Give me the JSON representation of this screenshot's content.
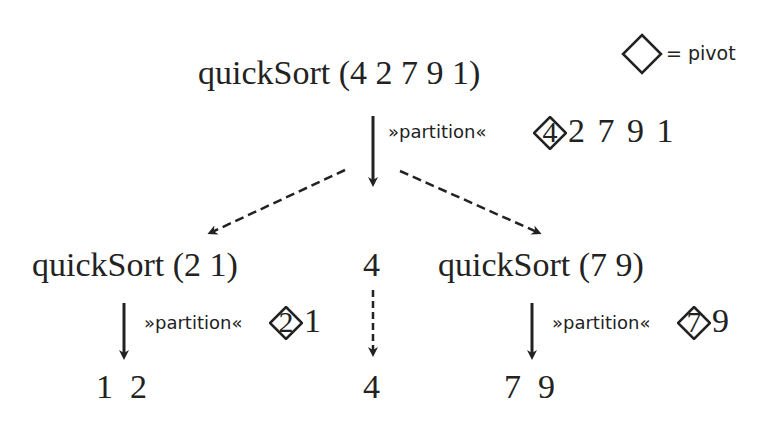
{
  "legend": {
    "symbol": "diamond",
    "text": "= pivot"
  },
  "root": {
    "call": "quickSort (4 2 7 9 1)",
    "operation": "»partition«",
    "pivot": "4",
    "rest": "2 7 9 1"
  },
  "left": {
    "call": "quickSort (2 1)",
    "operation": "»partition«",
    "pivot": "2",
    "rest": "1",
    "result": "1  2"
  },
  "middle": {
    "value": "4",
    "result": "4"
  },
  "right": {
    "call": "quickSort (7 9)",
    "operation": "»partition«",
    "pivot": "7",
    "rest": "9",
    "result": "7  9"
  },
  "colors": {
    "ink": "#222222",
    "background": "#ffffff"
  }
}
